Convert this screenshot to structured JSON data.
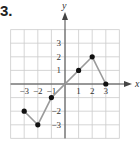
{
  "problem_number": "3.",
  "chart_data": {
    "type": "line",
    "title": "",
    "xlabel": "x",
    "ylabel": "y",
    "xlim": [
      -4,
      4
    ],
    "ylim": [
      -4,
      4
    ],
    "grid": true,
    "x_tick_labels": [
      "-3",
      "-2",
      "-1",
      "1",
      "2",
      "3"
    ],
    "y_tick_labels": [
      "3",
      "2",
      "1",
      "-2",
      "-3"
    ],
    "series": [
      {
        "name": "piecewise",
        "points": [
          [
            -3,
            -2
          ],
          [
            -2,
            -3
          ],
          [
            -1,
            -1
          ],
          [
            1,
            1
          ],
          [
            2,
            2
          ],
          [
            3,
            0
          ]
        ],
        "segments": [
          [
            [
              -3,
              -2
            ],
            [
              -2,
              -3
            ]
          ],
          [
            [
              -2,
              -3
            ],
            [
              -1,
              -1
            ]
          ],
          [
            [
              -1,
              -1
            ],
            [
              2,
              2
            ]
          ],
          [
            [
              2,
              2
            ],
            [
              3,
              0
            ]
          ]
        ]
      }
    ],
    "line_color": "#999999",
    "point_color": "#111111"
  }
}
